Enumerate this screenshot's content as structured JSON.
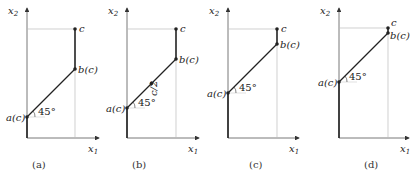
{
  "figure": {
    "panels": [
      {
        "caption": "(a)",
        "x_axis_label": "x1",
        "y_axis_label": "x2",
        "point_a_label": "a(c)",
        "point_b_label": "b(c)",
        "point_c_label": "c",
        "angle_label": "45°"
      },
      {
        "caption": "(b)",
        "x_axis_label": "x1",
        "y_axis_label": "x2",
        "point_a_label": "a(c)",
        "point_b_label": "b(c)",
        "point_c_label": "c",
        "angle_label": "45°",
        "midpoint_label": "c/2"
      },
      {
        "caption": "(c)",
        "x_axis_label": "x1",
        "y_axis_label": "x2",
        "point_a_label": "a(c)",
        "point_b_label": "b(c)",
        "point_c_label": "c",
        "angle_label": "45°"
      },
      {
        "caption": "(d)",
        "x_axis_label": "x1",
        "y_axis_label": "x2",
        "point_a_label": "a(c)",
        "point_b_label": "b(c)",
        "point_c_label": "c",
        "angle_label": "45°"
      }
    ],
    "colors": {
      "line": "#222222",
      "guide": "#bbbbbb"
    }
  }
}
